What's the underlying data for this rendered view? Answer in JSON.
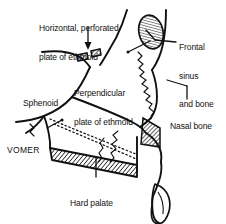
{
  "figure": {
    "type": "anatomical-diagram",
    "background_color": "#ffffff",
    "line_color": "#111111"
  },
  "labels": [
    {
      "id": "horizontal-plate",
      "text": "Horizontal, perforated\nplate of ethmoid",
      "lines": [
        "Horizontal, perforated",
        "plate of ethmoid"
      ],
      "x": 39,
      "y": 5,
      "style": "sentence"
    },
    {
      "id": "frontal-sinus",
      "text": "Frontal\nsinus\nand bone",
      "lines": [
        "Frontal",
        "sinus",
        "and bone"
      ],
      "x": 179,
      "y": 24,
      "style": "sentence"
    },
    {
      "id": "perpendicular-plate",
      "text": "Perpendicular\nplate of ethmoid",
      "lines": [
        "Perpendicular",
        "plate of ethmoid"
      ],
      "x": 74,
      "y": 70,
      "style": "sentence"
    },
    {
      "id": "sphenoid",
      "text": "Sphenoid",
      "lines": [
        "Sphenoid"
      ],
      "x": 23,
      "y": 80,
      "style": "sentence"
    },
    {
      "id": "nasal-bone",
      "text": "Nasal bone",
      "lines": [
        "Nasal bone"
      ],
      "x": 170,
      "y": 103,
      "style": "sentence"
    },
    {
      "id": "vomer",
      "text": "VOMER",
      "lines": [
        "VOMER"
      ],
      "x": 7,
      "y": 127,
      "style": "caps"
    },
    {
      "id": "hard-palate",
      "text": "Hard palate",
      "lines": [
        "Hard palate"
      ],
      "x": 70,
      "y": 180,
      "style": "sentence"
    }
  ],
  "structures": [
    {
      "id": "cribriform-plate",
      "name": "cribriform plate segments",
      "fill": "hatched"
    },
    {
      "id": "frontal-sinus-cavity",
      "name": "frontal sinus",
      "fill": "hatched-oval"
    },
    {
      "id": "hard-palate-band",
      "name": "hard palate",
      "fill": "hatched-band"
    },
    {
      "id": "vomer-outline",
      "name": "vomer",
      "fill": "dotted-outline"
    },
    {
      "id": "nasal-bone-wedge",
      "name": "nasal bone",
      "fill": "hatched-wedge"
    },
    {
      "id": "incisor-tooth",
      "name": "incisor tooth",
      "fill": "outline"
    }
  ]
}
